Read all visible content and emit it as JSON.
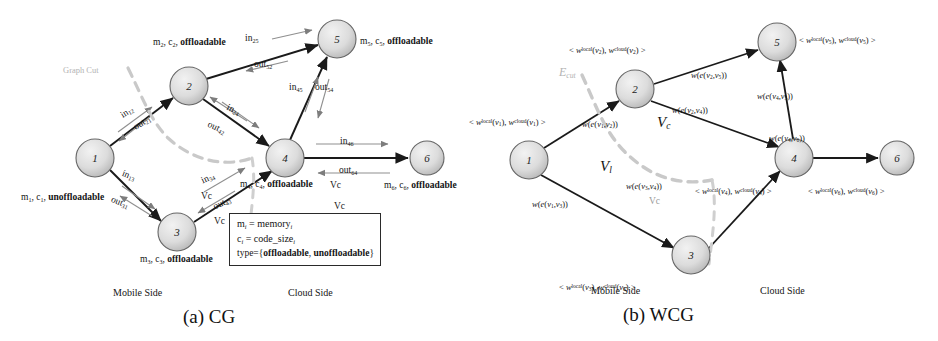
{
  "figure": {
    "panel_a": {
      "caption": "(a) CG",
      "side_labels": {
        "mobile": "Mobile Side",
        "cloud": "Cloud Side"
      },
      "graph_cut_label": "Graph Cut",
      "nodes": [
        {
          "id": "1",
          "x": 95,
          "y": 158,
          "r": 19
        },
        {
          "id": "2",
          "x": 189,
          "y": 86,
          "r": 19
        },
        {
          "id": "3",
          "x": 177,
          "y": 232,
          "r": 19
        },
        {
          "id": "4",
          "x": 285,
          "y": 158,
          "r": 19
        },
        {
          "id": "5",
          "x": 337,
          "y": 39,
          "r": 19
        },
        {
          "id": "6",
          "x": 427,
          "y": 158,
          "r": 17
        }
      ],
      "node_labels": [
        {
          "for": "1",
          "text": "m1, c1, unoffloadable",
          "base": "m",
          "sub1": "1",
          "base2": "c",
          "sub2": "1",
          "type": "unoffloadable"
        },
        {
          "for": "2",
          "text": "m2, c2, offloadable",
          "type": "offloadable"
        },
        {
          "for": "3",
          "text": "m3, c3, offloadable",
          "type": "offloadable"
        },
        {
          "for": "4",
          "text": "m4, c4, offloadable",
          "type": "offloadable"
        },
        {
          "for": "5",
          "text": "m5, c5, offloadable",
          "type": "offloadable"
        },
        {
          "for": "6",
          "text": "m6, c6, offloadable",
          "type": "offloadable"
        }
      ],
      "edge_labels": [
        {
          "name": "in12",
          "prefix": "in",
          "sub": "12"
        },
        {
          "name": "out21",
          "prefix": "out",
          "sub": "21"
        },
        {
          "name": "in13",
          "prefix": "in",
          "sub": "13"
        },
        {
          "name": "out31",
          "prefix": "out",
          "sub": "31"
        },
        {
          "name": "in25",
          "prefix": "in",
          "sub": "25"
        },
        {
          "name": "out52",
          "prefix": "out",
          "sub": "52"
        },
        {
          "name": "in24",
          "prefix": "in",
          "sub": "24"
        },
        {
          "name": "out42",
          "prefix": "out",
          "sub": "42"
        },
        {
          "name": "in34",
          "prefix": "in",
          "sub": "34"
        },
        {
          "name": "out43",
          "prefix": "out",
          "sub": "43"
        },
        {
          "name": "in45",
          "prefix": "in",
          "sub": "45"
        },
        {
          "name": "out54",
          "prefix": "out",
          "sub": "54"
        },
        {
          "name": "in46",
          "prefix": "in",
          "sub": "46"
        },
        {
          "name": "out64",
          "prefix": "out",
          "sub": "64"
        }
      ],
      "vc_markers": [
        "Vc",
        "Vc",
        "Vc",
        "Vc"
      ],
      "legend": {
        "line1_lhs": "m",
        "line1_sub": "i",
        "line1_eq": " = memory",
        "line1_sub2": "i",
        "line2_lhs": "c",
        "line2_sub": "i",
        "line2_eq": " = code_size",
        "line2_sub2": "i",
        "line3": "type={offloadable, unoffloadable}"
      }
    },
    "panel_b": {
      "caption": "(b) WCG",
      "side_labels": {
        "mobile": "Mobile Side",
        "cloud": "Cloud Side"
      },
      "ecut_label": "E",
      "ecut_sub": "cut",
      "region_labels": [
        {
          "name": "Vc",
          "base": "V",
          "sub": "c"
        },
        {
          "name": "Vl",
          "base": "V",
          "sub": "l"
        }
      ],
      "nodes": [
        {
          "id": "1",
          "x": 60,
          "y": 160,
          "r": 19
        },
        {
          "id": "2",
          "x": 166,
          "y": 89,
          "r": 19
        },
        {
          "id": "3",
          "x": 222,
          "y": 255,
          "r": 19
        },
        {
          "id": "4",
          "x": 325,
          "y": 158,
          "r": 19
        },
        {
          "id": "5",
          "x": 308,
          "y": 42,
          "r": 19
        },
        {
          "id": "6",
          "x": 428,
          "y": 158,
          "r": 17
        }
      ],
      "node_weight_labels": [
        {
          "for": "1",
          "text": "< w^local(v1), w^cloud(v1) >",
          "v": "1"
        },
        {
          "for": "2",
          "text": "< w^local(v2), w^cloud(v2) >",
          "v": "2"
        },
        {
          "for": "3",
          "text": "< w^local(v3), w^cloud(v3) >",
          "v": "3"
        },
        {
          "for": "4",
          "text": "< w^local(v4), w^cloud(v4) >",
          "v": "4"
        },
        {
          "for": "5",
          "text": "< w^local(v5), w^cloud(v5) >",
          "v": "5"
        },
        {
          "for": "6",
          "text": "< w^local(v6), w^cloud(v6) >",
          "v": "6"
        }
      ],
      "edge_weight_labels": [
        {
          "name": "w_e_v1_v2",
          "from": "1",
          "to": "2"
        },
        {
          "name": "w_e_v1_v3",
          "from": "1",
          "to": "3"
        },
        {
          "name": "w_e_v2_v5",
          "from": "2",
          "to": "5"
        },
        {
          "name": "w_e_v2_v4",
          "from": "2",
          "to": "4"
        },
        {
          "name": "w_e_v3_v4",
          "from": "3",
          "to": "4"
        },
        {
          "name": "w_e_v4_v5",
          "from": "4",
          "to": "5"
        },
        {
          "name": "w_e_v4_v6",
          "from": "4",
          "to": "6"
        }
      ],
      "vc_marker": "Vc"
    },
    "colors": {
      "node_fill": "#d8d8d8",
      "node_stroke": "#555555",
      "edge": "#1a1a1a",
      "thin_edge": "#8a8a8a",
      "cut_dash": "#c2c2c2",
      "text": "#141414",
      "faint_text": "#b5b5b5"
    }
  }
}
